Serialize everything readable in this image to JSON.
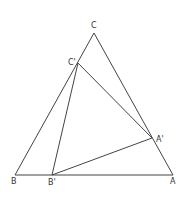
{
  "diagram": {
    "points": {
      "A": {
        "label": "A",
        "x": 173,
        "y": 175
      },
      "B": {
        "label": "B",
        "x": 15,
        "y": 175
      },
      "C": {
        "label": "C",
        "x": 94,
        "y": 33
      },
      "A_prime": {
        "label": "A'",
        "x": 152,
        "y": 138
      },
      "B_prime": {
        "label": "B'",
        "x": 52,
        "y": 175
      },
      "C_prime": {
        "label": "C'",
        "x": 78,
        "y": 63
      }
    },
    "line_color": "#444444"
  }
}
